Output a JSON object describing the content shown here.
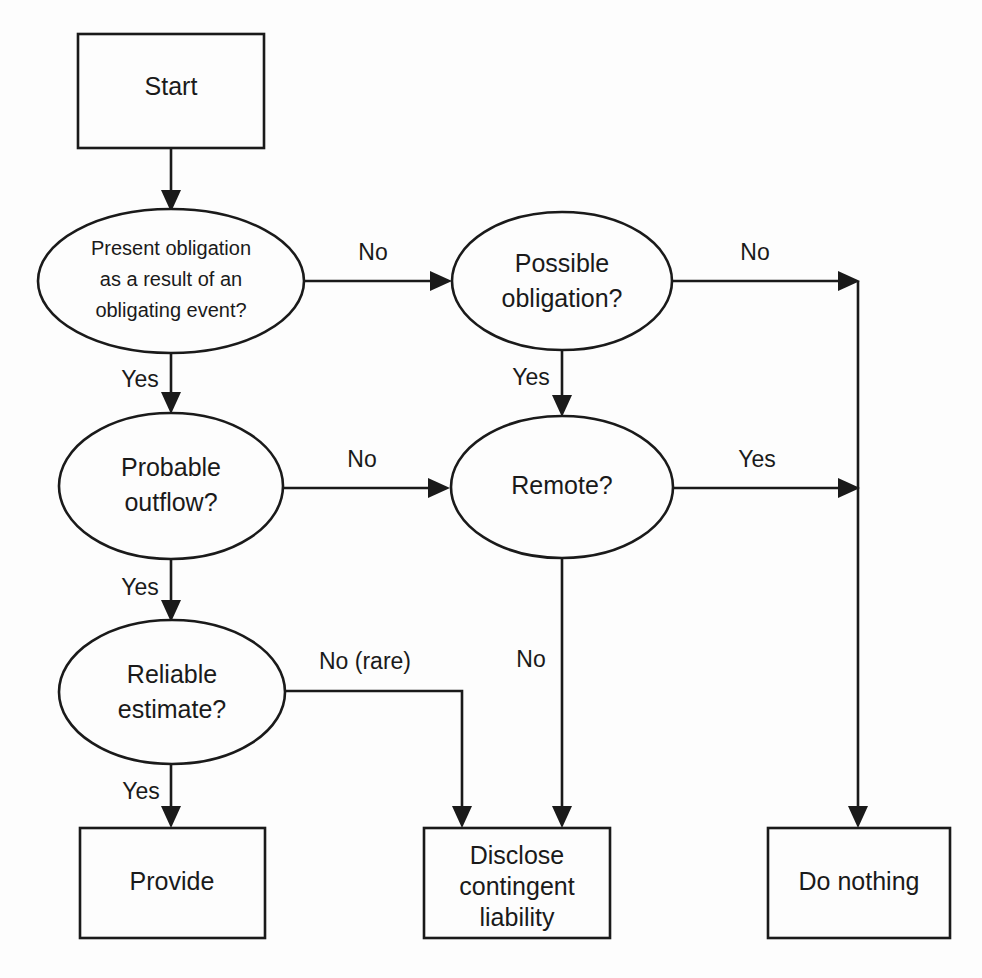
{
  "diagram": {
    "type": "flowchart",
    "background_color": "#fdfdfd",
    "line_color": "#1a1a1a",
    "shape_fill": "#fdfdfd",
    "nodes": {
      "start": {
        "shape": "rectangle",
        "label": "Start"
      },
      "present_obligation": {
        "shape": "ellipse",
        "line1": "Present obligation",
        "line2": "as a result of an",
        "line3": "obligating event?"
      },
      "possible_obligation": {
        "shape": "ellipse",
        "line1": "Possible",
        "line2": "obligation?"
      },
      "probable_outflow": {
        "shape": "ellipse",
        "line1": "Probable",
        "line2": "outflow?"
      },
      "remote": {
        "shape": "ellipse",
        "line1": "Remote?"
      },
      "reliable_estimate": {
        "shape": "ellipse",
        "line1": "Reliable",
        "line2": "estimate?"
      },
      "provide": {
        "shape": "rectangle",
        "label": "Provide"
      },
      "disclose": {
        "shape": "rectangle",
        "line1": "Disclose",
        "line2": "contingent",
        "line3": "liability"
      },
      "do_nothing": {
        "shape": "rectangle",
        "label": "Do nothing"
      }
    },
    "edge_labels": {
      "present_to_possible": "No",
      "present_to_probable": "Yes",
      "possible_to_donothing": "No",
      "possible_to_remote": "Yes",
      "probable_to_remote": "No",
      "probable_to_reliable": "Yes",
      "remote_to_donothing": "Yes",
      "remote_to_disclose": "No",
      "reliable_to_provide": "Yes",
      "reliable_to_disclose": "No (rare)"
    }
  }
}
